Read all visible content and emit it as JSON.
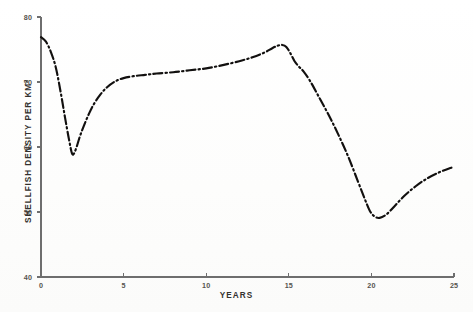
{
  "chart_data": {
    "type": "line",
    "title": "",
    "xlabel": "YEARS",
    "ylabel": "SHELLFISH DENSITY PER KM",
    "ylabel_superscript": "2",
    "xlim": [
      0,
      25
    ],
    "ylim": [
      40,
      80
    ],
    "xticks": [
      "0",
      "5",
      "10",
      "15",
      "20",
      "25"
    ],
    "xtick_values": [
      0,
      5,
      10,
      15,
      20,
      25
    ],
    "yticks": [
      "40",
      "50",
      "60",
      "70",
      "80"
    ],
    "ytick_values": [
      40,
      50,
      60,
      70,
      80
    ],
    "grid": false,
    "legend": false,
    "line_style": "dash-dot",
    "line_color": "#12100f",
    "axis_color": "#6e6e6e",
    "series": [
      {
        "name": "Shellfish density",
        "x": [
          0.0,
          0.3,
          0.6,
          0.9,
          1.2,
          1.45,
          1.7,
          1.9,
          2.1,
          2.35,
          2.6,
          2.9,
          3.2,
          3.6,
          4.0,
          4.5,
          5.0,
          5.6,
          6.3,
          7.0,
          8.0,
          9.0,
          10.0,
          11.0,
          12.0,
          12.8,
          13.5,
          14.0,
          14.35,
          14.6,
          14.85,
          15.1,
          15.35,
          15.6,
          15.9,
          16.3,
          16.8,
          17.4,
          18.0,
          18.6,
          19.2,
          19.6,
          19.9,
          20.2,
          20.5,
          20.9,
          21.4,
          22.0,
          22.7,
          23.4,
          24.1,
          24.7,
          25.0
        ],
        "y": [
          76.9,
          76.2,
          74.6,
          72.2,
          68.3,
          64.6,
          61.1,
          58.9,
          59.6,
          61.6,
          63.3,
          65.1,
          66.6,
          68.1,
          69.2,
          70.1,
          70.6,
          70.9,
          71.1,
          71.3,
          71.5,
          71.8,
          72.1,
          72.6,
          73.2,
          73.8,
          74.5,
          75.2,
          75.6,
          75.7,
          75.4,
          74.4,
          73.2,
          72.4,
          71.6,
          70.1,
          67.8,
          65.0,
          61.9,
          58.5,
          54.6,
          52.0,
          50.2,
          49.3,
          49.1,
          49.6,
          50.9,
          52.5,
          54.0,
          55.2,
          56.1,
          56.7,
          56.9
        ]
      }
    ],
    "annotations": {
      "start_value": 76.9,
      "first_minimum": {
        "year": 1.9,
        "value": 58.9
      },
      "plateau_value": 71.3,
      "peak": {
        "year": 14.6,
        "value": 75.7
      },
      "second_minimum": {
        "year": 20.4,
        "value": 49.1
      },
      "end_value": 56.9
    }
  }
}
